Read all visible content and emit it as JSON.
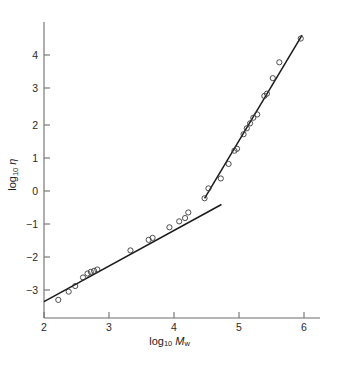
{
  "figure": {
    "name": "viscosity-molecular-weight-log-log-plot",
    "background_color": "#ffffff",
    "line_color": "#1a1a1a",
    "axis_color": "#6d6d6d",
    "marker_color": "#3a3a3a"
  },
  "axes": {
    "x": {
      "label_prefix": "log",
      "label_sub": "10",
      "label_var": "M",
      "label_var_sub": "w",
      "ticks": [
        "2",
        "3",
        "4",
        "5",
        "6"
      ],
      "tick_values": [
        2,
        3,
        4,
        5,
        6
      ],
      "range": [
        1.78,
        6.32
      ]
    },
    "y": {
      "label_prefix": "log",
      "label_sub": "10",
      "label_var": "η",
      "ticks": [
        "4",
        "3",
        "2",
        "1",
        "0",
        "−1",
        "−2",
        "−3"
      ],
      "tick_values": [
        4,
        3,
        2,
        1,
        0,
        -1,
        -2,
        -3
      ],
      "range": [
        -3.62,
        4.82
      ]
    }
  },
  "chart_data": {
    "type": "scatter",
    "title": "",
    "xlabel": "log10 Mw",
    "ylabel": "log10 eta",
    "xlim": [
      1.78,
      6.32
    ],
    "ylim": [
      -3.62,
      4.82
    ],
    "grid": false,
    "legend": "none",
    "marker": "open-circle",
    "series": [
      {
        "name": "measured viscosity",
        "x": [
          2.22,
          2.38,
          2.48,
          2.6,
          2.67,
          2.72,
          2.77,
          2.82,
          3.33,
          3.61,
          3.67,
          3.93,
          4.08,
          4.17,
          4.22,
          4.47,
          4.53,
          4.72,
          4.84,
          4.93,
          4.97,
          5.07,
          5.12,
          5.17,
          5.22,
          5.28,
          5.39,
          5.43,
          5.52,
          5.62,
          5.95
        ],
        "y": [
          -3.3,
          -3.05,
          -2.88,
          -2.62,
          -2.5,
          -2.45,
          -2.42,
          -2.38,
          -1.8,
          -1.48,
          -1.42,
          -1.1,
          -0.92,
          -0.82,
          -0.65,
          -0.22,
          0.08,
          0.38,
          0.82,
          1.22,
          1.28,
          1.72,
          1.9,
          2.05,
          2.22,
          2.32,
          2.88,
          2.95,
          3.42,
          3.9,
          4.62
        ]
      }
    ],
    "fit_lines": [
      {
        "name": "low-molecular-weight-regime",
        "description": "shallow slope, pre-entanglement region",
        "slope": 1.0,
        "x_start": 2.0,
        "y_start": -3.35,
        "x_end": 4.73,
        "y_end": -0.41
      },
      {
        "name": "high-molecular-weight-regime",
        "description": "steep slope, entangled region",
        "slope": 3.4,
        "x_start": 4.47,
        "y_start": -0.22,
        "x_end": 5.97,
        "y_end": 4.72
      }
    ],
    "breakpoint": {
      "name": "critical-molecular-weight",
      "x": 4.53,
      "y": -0.14
    },
    "annotations": []
  }
}
